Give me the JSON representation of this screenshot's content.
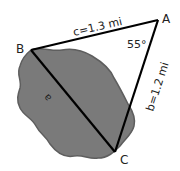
{
  "diagram": {
    "vertices": {
      "A": {
        "label": "A"
      },
      "B": {
        "label": "B"
      },
      "C": {
        "label": "C"
      }
    },
    "sides": {
      "a": {
        "label": "a"
      },
      "b": {
        "label": "b=1.2 mi"
      },
      "c": {
        "label": "c=1.3 mi"
      }
    },
    "angle_A": {
      "label": "55°"
    },
    "colors": {
      "blob_fill": "#7a7a7a",
      "blob_stroke": "#5e5e5e",
      "lines": "#000000"
    }
  }
}
